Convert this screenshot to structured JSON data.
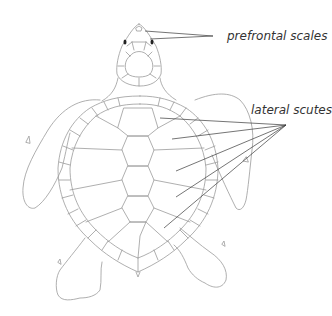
{
  "diagram": {
    "labels": [
      {
        "id": "prefrontal",
        "text": "prefrontal scales",
        "x": 227,
        "y": 40
      },
      {
        "id": "lateral",
        "text": "lateral scutes",
        "x": 251,
        "y": 112
      }
    ],
    "pointers": {
      "prefrontal": {
        "from": [
          213,
          36
        ],
        "targets": [
          [
            145,
            31
          ],
          [
            150,
            39
          ]
        ]
      },
      "lateral": {
        "from": [
          286,
          125
        ],
        "targets": [
          [
            160,
            118
          ],
          [
            172,
            139
          ],
          [
            176,
            171
          ],
          [
            176,
            197
          ],
          [
            164,
            228
          ]
        ]
      }
    },
    "colors": {
      "outline": "#9a9a9a",
      "pointer": "#3a3a3a",
      "label": "#333333",
      "background": "#ffffff"
    }
  }
}
